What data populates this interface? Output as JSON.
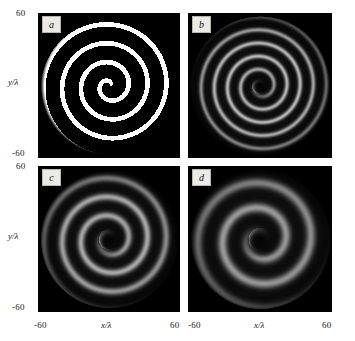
{
  "figure": {
    "background_color": "#ffffff",
    "panel_background": "#000000",
    "grid": "2x2"
  },
  "axes": {
    "y_label": "y/λ",
    "x_label": "x/λ",
    "y_tick_max": "60",
    "y_tick_min": "-60",
    "x_tick_min": "-60",
    "x_tick_max": "60"
  },
  "chart_data": {
    "type": "heatmap",
    "title": "",
    "xlabel": "x/λ",
    "ylabel": "y/λ",
    "xlim": [
      -60,
      60
    ],
    "ylim": [
      -60,
      60
    ],
    "grid": false,
    "legend": "none",
    "colormap": "grayscale",
    "panels": [
      {
        "label": "a",
        "description": "Binary high-contrast Archimedean spiral mask",
        "turns": 7.0,
        "arm_width_lambda": 4.0,
        "pitch_lambda": 16.0,
        "outer_radius_lambda": 58,
        "core_radius_lambda": 0,
        "peak_intensity": 1.0,
        "contrast": 1.0,
        "core": "bright",
        "handedness": "counter-clockwise"
      },
      {
        "label": "b",
        "description": "Diffracted spiral field, fine dense fringes, dark core",
        "turns": 9.5,
        "arm_width_lambda": 2.6,
        "pitch_lambda": 11.0,
        "outer_radius_lambda": 58,
        "core_radius_lambda": 7,
        "peak_intensity": 0.72,
        "contrast": 0.62,
        "core": "dark",
        "handedness": "counter-clockwise"
      },
      {
        "label": "c",
        "description": "Diffracted spiral field, medium fringe spacing, dark core",
        "turns": 6.5,
        "arm_width_lambda": 4.2,
        "pitch_lambda": 16.0,
        "outer_radius_lambda": 58,
        "core_radius_lambda": 9,
        "peak_intensity": 0.66,
        "contrast": 0.55,
        "core": "dark",
        "handedness": "counter-clockwise"
      },
      {
        "label": "d",
        "description": "Diffracted spiral field, widest fringes, strongest blur, dark core",
        "turns": 5.0,
        "arm_width_lambda": 5.6,
        "pitch_lambda": 21.0,
        "outer_radius_lambda": 58,
        "core_radius_lambda": 10,
        "peak_intensity": 0.6,
        "contrast": 0.48,
        "core": "dark",
        "handedness": "counter-clockwise"
      }
    ]
  }
}
